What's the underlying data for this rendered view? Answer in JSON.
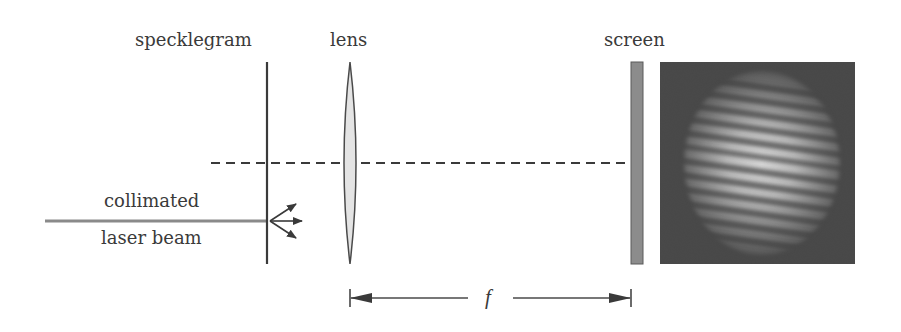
{
  "diagram": {
    "labels": {
      "specklegram": "specklegram",
      "lens": "lens",
      "screen": "screen",
      "beam_line1": "collimated",
      "beam_line2": "laser beam",
      "focal_length": "f"
    },
    "components": [
      {
        "id": "laser-beam",
        "type": "beam",
        "label": "collimated laser beam"
      },
      {
        "id": "specklegram",
        "type": "plate",
        "label": "specklegram"
      },
      {
        "id": "lens",
        "type": "convex-lens",
        "label": "lens"
      },
      {
        "id": "screen",
        "type": "screen",
        "label": "screen"
      },
      {
        "id": "fringe-pattern",
        "type": "image",
        "label": "Young's fringes pattern"
      }
    ],
    "annotations": {
      "optical_axis": "dashed",
      "scattered_rays": 3,
      "dimension": "f (lens to screen distance)"
    },
    "colors": {
      "ink": "#3a3a3a",
      "beam": "#8a8a8a",
      "lens_fill": "#e4e4e4",
      "screen_fill": "#8c8c8c",
      "fringe_bg": "#3c3c3c",
      "fringe_bright": "#e6e6e6"
    }
  }
}
